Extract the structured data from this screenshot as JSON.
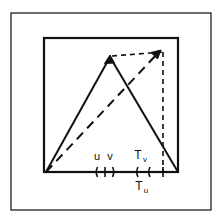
{
  "figure": {
    "width": 221,
    "height": 222,
    "background_color": "#ffffff",
    "ink_color": "#101010"
  },
  "frames": {
    "outer": {
      "x": 11,
      "y": 13,
      "width": 200,
      "height": 197,
      "stroke_width": 1.2
    },
    "inner": {
      "x": 44,
      "y": 38,
      "width": 134,
      "height": 134,
      "stroke_width": 2.2
    }
  },
  "shapes": {
    "triangle": {
      "name": "solid-triangle",
      "apex": {
        "x": 110,
        "y": 57
      },
      "base_left": {
        "x": 46,
        "y": 172
      },
      "base_right": {
        "x": 178,
        "y": 172
      },
      "stroke_width": 2,
      "style": "solid",
      "arrowhead_at": "apex"
    },
    "ramp_dashed": {
      "name": "dashed-diagonal-ramp",
      "from": {
        "x": 46,
        "y": 172
      },
      "to": {
        "x": 161,
        "y": 50
      },
      "style": "dashed",
      "dash_pattern": "9 6",
      "stroke_width": 2,
      "arrowhead_at": "to"
    },
    "horizontal_dashed": {
      "name": "dashed-horizontal-connector",
      "from": {
        "x": 110,
        "y": 56
      },
      "to": {
        "x": 163,
        "y": 52
      },
      "style": "dashed",
      "dash_pattern": "5 4",
      "stroke_width": 1.6
    },
    "vertical_dashed": {
      "name": "dashed-vertical-connector",
      "x": 163,
      "from_y": 52,
      "to_y": 172,
      "style": "dashed",
      "dash_pattern": "5 4",
      "stroke_width": 1.6
    }
  },
  "axis": {
    "baseline_y": 172,
    "tick_half_height": 5,
    "left_group": {
      "open_paren_x": 96,
      "divider_x": 105,
      "close_paren_x": 114,
      "labels": [
        {
          "text": "u",
          "x": 100,
          "y": 158
        },
        {
          "text": "v",
          "x": 109,
          "y": 158
        }
      ]
    },
    "right_group": {
      "open_paren_x": 136,
      "inner_paren_x": 148,
      "close_tick_x": 163,
      "labels_above": [
        {
          "text": "T",
          "sub": "v",
          "x": 142,
          "y": 157
        }
      ],
      "labels_below": [
        {
          "text": "T",
          "sub": "u",
          "x": 141,
          "y": 189
        }
      ]
    }
  },
  "labels": {
    "u": "u",
    "v": "v",
    "T": "T",
    "sub_v": "v",
    "sub_u": "u"
  }
}
